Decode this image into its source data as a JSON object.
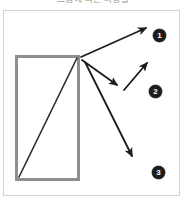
{
  "figure": {
    "caption": "그림에 따른 파생물",
    "frame": {
      "border_color": "#d2d2d2",
      "background": "#ffffff"
    },
    "shapes": {
      "rectangle": {
        "name": "outlined-rectangle",
        "x": 15,
        "y": 55,
        "width": 65,
        "height": 126,
        "stroke_color": "#8e8e8e",
        "stroke_width": 3,
        "fill": "#ffffff"
      },
      "diagonal": {
        "name": "rectangle-diagonal-line",
        "x1": 19,
        "y1": 177,
        "x2": 77,
        "y2": 58,
        "stroke_color": "#2b2b2b",
        "stroke_width": 1.6
      }
    },
    "arrows": [
      {
        "id": "arrow-1",
        "label": "1",
        "from": [
          81,
          57
        ],
        "to": [
          148,
          27
        ],
        "stroke_color": "#1c1c1c",
        "stroke_width": 1.8
      },
      {
        "id": "arrow-2a",
        "label": "2",
        "from": [
          82,
          60
        ],
        "to": [
          118,
          86
        ],
        "stroke_color": "#1c1c1c",
        "stroke_width": 1.8
      },
      {
        "id": "arrow-2b",
        "label": "2",
        "from": [
          124,
          90
        ],
        "to": [
          148,
          62
        ],
        "stroke_color": "#1c1c1c",
        "stroke_width": 1.8
      },
      {
        "id": "arrow-3",
        "label": "3",
        "from": [
          85,
          62
        ],
        "to": [
          133,
          158
        ],
        "stroke_color": "#1c1c1c",
        "stroke_width": 1.8
      }
    ],
    "markers": [
      {
        "id": "marker-1",
        "number": "1",
        "x": 153,
        "y": 29,
        "fill": "#1c1c1c",
        "text_color": "#ffffff"
      },
      {
        "id": "marker-2",
        "number": "2",
        "x": 149,
        "y": 85,
        "fill": "#1c1c1c",
        "text_color": "#ffffff"
      },
      {
        "id": "marker-3",
        "number": "3",
        "x": 152,
        "y": 166,
        "fill": "#1c1c1c",
        "text_color": "#ffffff"
      }
    ]
  }
}
